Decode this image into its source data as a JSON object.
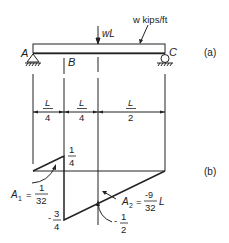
{
  "figure": {
    "part_a": {
      "label": "(a)",
      "support_left": "A",
      "point_b": "B",
      "support_right": "C",
      "point_load": "wL",
      "distributed_load": "w kips/ft"
    },
    "dimensions": [
      {
        "num": "L",
        "den": "4"
      },
      {
        "num": "L",
        "den": "4"
      },
      {
        "num": "L",
        "den": "2"
      }
    ],
    "part_b": {
      "label": "(b)",
      "peak_positive": {
        "num": "1",
        "den": "4"
      },
      "peak_negative": {
        "sign": "-",
        "num": "3",
        "den": "4"
      },
      "value_at_load": {
        "sign": "-",
        "num": "1",
        "den": "2"
      },
      "area1": {
        "name": "A",
        "sub": "1",
        "eq": "=",
        "num": "1",
        "den": "32"
      },
      "area2": {
        "name": "A",
        "sub": "2",
        "eq": "=",
        "num": "-9",
        "den": "32",
        "suffix": "L"
      }
    },
    "colors": {
      "line": "#222222",
      "background": "#ffffff"
    }
  }
}
